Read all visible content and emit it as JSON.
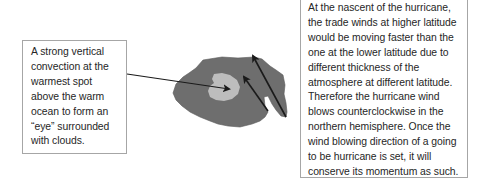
{
  "diagram": {
    "left_note": {
      "text": "A strong vertical\nconvection at the\nwarmest spot\nabove the warm\nocean to form an\n“eye” surrounded\nwith clouds."
    },
    "right_note": {
      "text": "At the nascent of the hurricane,\nthe trade winds at higher latitude\nwould be moving faster than the\none at the lower latitude due to\ndifferent thickness of the\natmosphere at different latitude.\nTherefore the hurricane wind\nblows counterclockwise in the\nnorthern hemisphere. Once the\nwind blowing direction of a going\nto be hurricane is set, it will\nconserve its momentum as such."
    },
    "colors": {
      "cloud": "#6e6e6e",
      "eye": "#bdbdbd",
      "arrow": "#1a1a1a",
      "box_border": "#a6a6a6",
      "text": "#262626"
    }
  }
}
